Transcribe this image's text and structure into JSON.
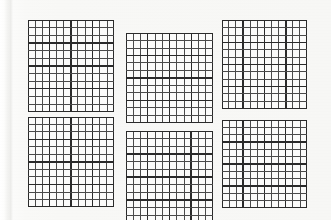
{
  "document": {
    "kind": "scanned-grid-sheet",
    "title": "Grid Squares Sheet",
    "page_width": 331,
    "page_height": 220,
    "background_color": "#f8f8f6",
    "paper_color": "#fbfbfa",
    "ink_color": "#2a2a2a",
    "ink_color_light": "#4a4a4a",
    "description": "Six ruled grid squares arranged in three columns and two rows on off-white scanned paper."
  },
  "artifacts": {
    "left_scan_line": {
      "name": "vertical-scan-streak",
      "x": 8,
      "width": 5,
      "color": "#ececea"
    }
  },
  "grids": [
    {
      "id": "grid-top-left",
      "label": "Top left grid",
      "x": 28,
      "y": 20,
      "width": 86,
      "height": 92,
      "columns": 12,
      "rows": 12,
      "border_width": 1.6,
      "line_width": 1.0,
      "heavy_every": 3,
      "heavy_line_width": 1.5,
      "cropped": false
    },
    {
      "id": "grid-top-middle",
      "label": "Top middle grid",
      "x": 126,
      "y": 33,
      "width": 87,
      "height": 90,
      "columns": 12,
      "rows": 12,
      "border_width": 1.6,
      "line_width": 1.0,
      "heavy_every": 3,
      "heavy_line_width": 1.5,
      "cropped": false
    },
    {
      "id": "grid-top-right",
      "label": "Top right grid",
      "x": 222,
      "y": 20,
      "width": 85,
      "height": 89,
      "columns": 12,
      "rows": 12,
      "border_width": 1.6,
      "line_width": 1.0,
      "heavy_every": 3,
      "heavy_line_width": 1.5,
      "cropped": false
    },
    {
      "id": "grid-bottom-left",
      "label": "Bottom left grid",
      "x": 28,
      "y": 117,
      "width": 86,
      "height": 90,
      "columns": 12,
      "rows": 12,
      "border_width": 1.6,
      "line_width": 1.0,
      "heavy_every": 3,
      "heavy_line_width": 1.5,
      "cropped": false
    },
    {
      "id": "grid-bottom-middle",
      "label": "Bottom middle grid",
      "x": 126,
      "y": 131,
      "width": 87,
      "height": 92,
      "columns": 12,
      "rows": 12,
      "border_width": 1.6,
      "line_width": 1.0,
      "heavy_every": 3,
      "heavy_line_width": 1.5,
      "cropped": true
    },
    {
      "id": "grid-bottom-right",
      "label": "Bottom right grid",
      "x": 222,
      "y": 120,
      "width": 85,
      "height": 88,
      "columns": 12,
      "rows": 12,
      "border_width": 1.6,
      "line_width": 1.0,
      "heavy_every": 3,
      "heavy_line_width": 1.5,
      "cropped": false
    }
  ]
}
